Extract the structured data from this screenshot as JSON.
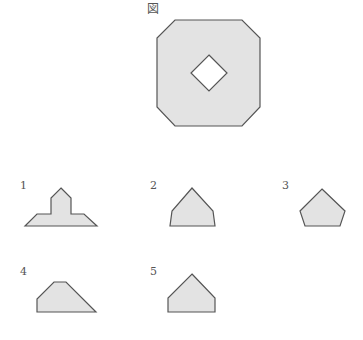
{
  "figure": {
    "title": "図",
    "outer_shape": "octagon",
    "inner_hole": "diamond"
  },
  "options": [
    {
      "label": "1",
      "shape": "cross-topped-trapezoid"
    },
    {
      "label": "2",
      "shape": "pentagon-tall"
    },
    {
      "label": "3",
      "shape": "pentagon-regular"
    },
    {
      "label": "4",
      "shape": "irregular-quadrilateral-trapezoid"
    },
    {
      "label": "5",
      "shape": "house-pentagon"
    }
  ],
  "colors": {
    "fill": "#e3e3e3",
    "stroke": "#555555",
    "background": "#ffffff"
  }
}
